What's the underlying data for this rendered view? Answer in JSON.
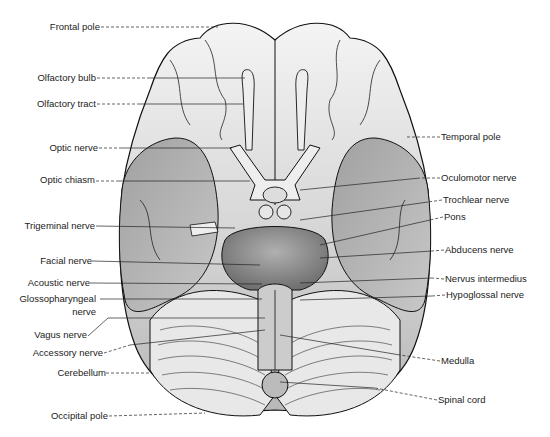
{
  "figure": {
    "labels_left": [
      {
        "id": "frontal-pole",
        "text": "Frontal pole",
        "x": 100,
        "y": 27
      },
      {
        "id": "olfactory-bulb",
        "text": "Olfactory bulb",
        "x": 96,
        "y": 78
      },
      {
        "id": "olfactory-tract",
        "text": "Olfactory tract",
        "x": 96,
        "y": 104
      },
      {
        "id": "optic-nerve",
        "text": "Optic nerve",
        "x": 98,
        "y": 148
      },
      {
        "id": "optic-chiasm",
        "text": "Optic chiasm",
        "x": 95,
        "y": 180
      },
      {
        "id": "trigeminal-nerve",
        "text": "Trigeminal nerve",
        "x": 95,
        "y": 226
      },
      {
        "id": "facial-nerve",
        "text": "Facial nerve",
        "x": 92,
        "y": 261
      },
      {
        "id": "acoustic-nerve",
        "text": "Acoustic nerve",
        "x": 90,
        "y": 283
      },
      {
        "id": "glossopharyngeal-nerve",
        "text": "Glossopharyngeal",
        "x": 96,
        "y": 299
      },
      {
        "id": "glossopharyngeal-nerve-2",
        "text": "nerve",
        "x": 96,
        "y": 312
      },
      {
        "id": "vagus-nerve",
        "text": "Vagus nerve",
        "x": 87,
        "y": 335
      },
      {
        "id": "accessory-nerve",
        "text": "Accessory nerve",
        "x": 103,
        "y": 353
      },
      {
        "id": "cerebellum",
        "text": "Cerebellum",
        "x": 106,
        "y": 373
      },
      {
        "id": "occipital-pole",
        "text": "Occipital pole",
        "x": 108,
        "y": 416
      }
    ],
    "labels_right": [
      {
        "id": "temporal-pole",
        "text": "Temporal pole",
        "x": 441,
        "y": 137
      },
      {
        "id": "oculomotor-nerve",
        "text": "Oculomotor nerve",
        "x": 441,
        "y": 178
      },
      {
        "id": "trochlear-nerve",
        "text": "Trochlear nerve",
        "x": 443,
        "y": 200
      },
      {
        "id": "pons",
        "text": "Pons",
        "x": 444,
        "y": 217
      },
      {
        "id": "abducens-nerve",
        "text": "Abducens nerve",
        "x": 445,
        "y": 250
      },
      {
        "id": "nervus-intermedius",
        "text": "Nervus intermedius",
        "x": 445,
        "y": 279
      },
      {
        "id": "hypoglossal-nerve",
        "text": "Hypoglossal nerve",
        "x": 446,
        "y": 295
      },
      {
        "id": "medulla",
        "text": "Medulla",
        "x": 441,
        "y": 361
      },
      {
        "id": "spinal-cord",
        "text": "Spinal cord",
        "x": 438,
        "y": 400
      }
    ]
  }
}
